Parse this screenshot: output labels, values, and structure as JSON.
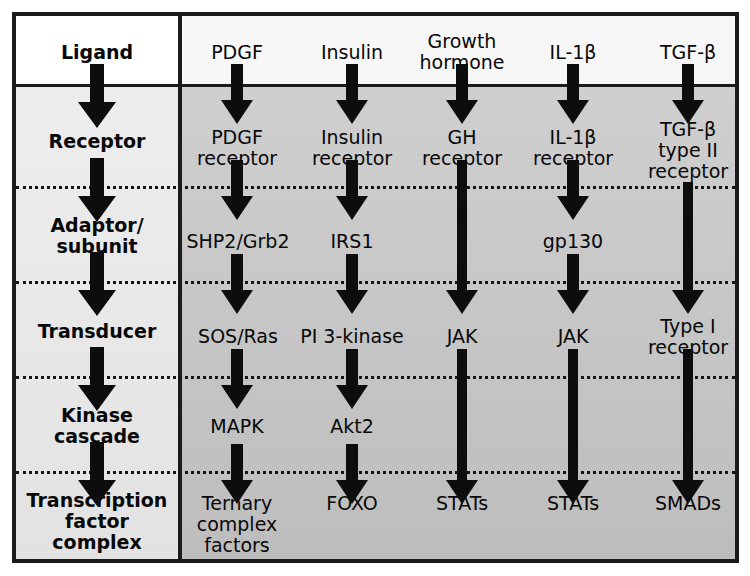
{
  "figure": {
    "type": "signal-transduction-pathway-flowchart",
    "row_label_column_header": "",
    "colors": {
      "border": "#1b1b1b",
      "label_column_bg": "#ececec",
      "pathway_bg": "#c9c9c9",
      "ligand_row_bg": "#ffffff",
      "arrow": "#0d0d0d",
      "text": "#080808"
    }
  },
  "stages": [
    {
      "id": "ligand",
      "label": "Ligand"
    },
    {
      "id": "receptor",
      "label": "Receptor"
    },
    {
      "id": "adaptor",
      "label": "Adaptor/\nsubunit"
    },
    {
      "id": "transducer",
      "label": "Transducer"
    },
    {
      "id": "kinase",
      "label": "Kinase\ncascade"
    },
    {
      "id": "transcription",
      "label": "Transcription\nfactor\ncomplex"
    }
  ],
  "pathways": [
    {
      "id": "pdgf",
      "ligand": "PDGF",
      "receptor": "PDGF\nreceptor",
      "adaptor": "SHP2/Grb2",
      "transducer": "SOS/Ras",
      "kinase": "MAPK",
      "transcription": "Ternary\ncomplex\nfactors"
    },
    {
      "id": "insulin",
      "ligand": "Insulin",
      "receptor": "Insulin\nreceptor",
      "adaptor": "IRS1",
      "transducer": "PI 3-kinase",
      "kinase": "Akt2",
      "transcription": "FOXO"
    },
    {
      "id": "growth-hormone",
      "ligand": "Growth\nhormone",
      "receptor": "GH\nreceptor",
      "adaptor": "",
      "transducer": "JAK",
      "kinase": "",
      "transcription": "STATs"
    },
    {
      "id": "il1beta",
      "ligand": "IL-1β",
      "receptor": "IL-1β\nreceptor",
      "adaptor": "gp130",
      "transducer": "JAK",
      "kinase": "",
      "transcription": "STATs"
    },
    {
      "id": "tgfbeta",
      "ligand": "TGF-β",
      "receptor": "TGF-β\ntype II\nreceptor",
      "adaptor": "",
      "transducer": "Type I\nreceptor",
      "kinase": "",
      "transcription": "SMADs"
    }
  ]
}
